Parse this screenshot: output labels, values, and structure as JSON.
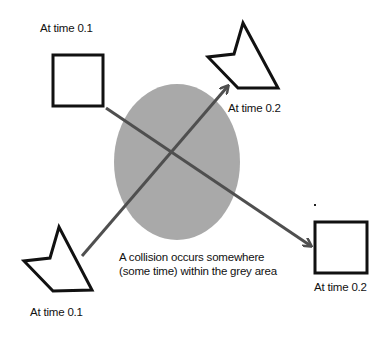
{
  "labels": {
    "square_start": "At time 0.1",
    "kite_end": "At time 0.2",
    "kite_start": "At time 0.1",
    "square_end": "At time 0.2"
  },
  "caption": {
    "line1": "A collision occurs somewhere",
    "line2": "(some time) within the grey area"
  },
  "colors": {
    "region_fill": "#a9a9a9",
    "arrow": "#4f4f4f",
    "shape_stroke": "#111111"
  }
}
